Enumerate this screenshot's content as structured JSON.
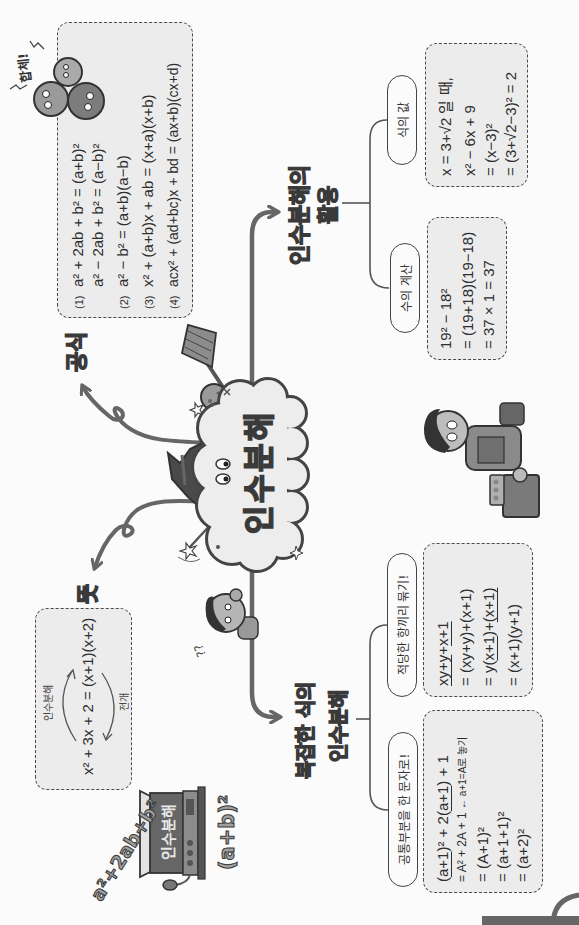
{
  "center": {
    "title": "인수분해"
  },
  "formulas": {
    "label": "공식",
    "items": [
      {
        "num": "(1)",
        "text": "a² + 2ab + b² = (a+b)²"
      },
      {
        "num": "",
        "text": "a² − 2ab + b² = (a−b)²"
      },
      {
        "num": "(2)",
        "text": "a² − b² = (a+b)(a−b)"
      },
      {
        "num": "(3)",
        "text": "x² + (a+b)x + ab = (x+a)(x+b)"
      },
      {
        "num": "(4)",
        "text": "acx² + (ad+bc)x + bd = (ax+b)(cx+d)"
      }
    ]
  },
  "meaning": {
    "label": "뜻",
    "equation": "x² + 3x + 2 = (x+1)(x+2)",
    "factorization_label": "인수분해",
    "expansion_label": "전개"
  },
  "application": {
    "label_line1": "인수분해의",
    "label_line2": "활용",
    "numeric": {
      "pill": "수의 계산",
      "lines": [
        "19² − 18²",
        "= (19+18)(19−18)",
        "= 37 × 1 = 37"
      ]
    },
    "value": {
      "pill": "식의 값",
      "lines": [
        "x = 3+√2 일 때,",
        "x² − 6x + 9",
        "= (x−3)²",
        "= (3+√2−3)² = 2"
      ]
    }
  },
  "complex": {
    "label_line1": "복잡한 식의",
    "label_line2": "인수분해",
    "grouping": {
      "pill": "적당한 항끼리 묶기!",
      "lines": [
        [
          "xy+y",
          "+",
          "x+1"
        ],
        [
          "= (xy+y)+(x+1)"
        ],
        [
          "= y(",
          "x+1",
          ")+",
          "(x+1)"
        ],
        [
          "= (x+1)(y+1)"
        ]
      ]
    },
    "substitution": {
      "pill": "공통부분을 한 문자로!",
      "lines": [
        [
          "(",
          "a+1",
          ")² + 2(",
          "a+1",
          ") + 1"
        ],
        [
          "= A² + 2A + 1 ",
          "← a+1=A로 놓기"
        ],
        [
          "= (A+1)²"
        ],
        [
          "= (a+1+1)²"
        ],
        [
          "= (a+2)²"
        ]
      ]
    }
  },
  "decorations": {
    "shout": "합체!",
    "radio_sign": "인수분해",
    "expression_expanded": "a²+2ab+b²",
    "expression_squared": "(a+b)²",
    "confused": "??"
  },
  "colors": {
    "line": "#666666",
    "box_fill": "#ececec",
    "box_border": "#4a4a4a",
    "label_fill": "#9c9c9c",
    "outline": "#3a3a3a"
  }
}
